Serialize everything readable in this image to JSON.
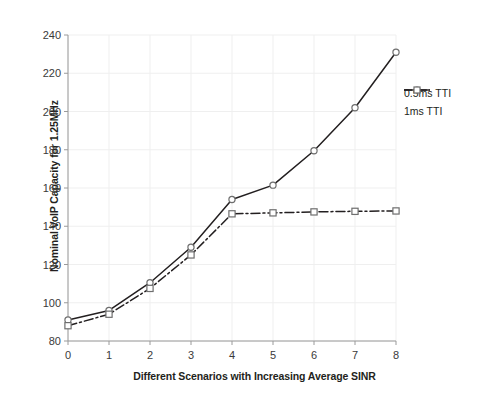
{
  "chart_data": {
    "type": "line",
    "title": "",
    "xlabel": "Different Scenarios with Increasing Average SINR",
    "ylabel": "Nominal VoIP Capacity for 1.25MHz",
    "x": [
      0,
      1,
      2,
      3,
      4,
      5,
      6,
      7,
      8
    ],
    "xlim": [
      0,
      8
    ],
    "ylim": [
      80,
      240
    ],
    "xticks": [
      "0",
      "1",
      "2",
      "3",
      "4",
      "5",
      "6",
      "7",
      "8"
    ],
    "yticks": [
      "80",
      "100",
      "120",
      "140",
      "160",
      "180",
      "200",
      "220",
      "240"
    ],
    "grid": true,
    "legend_position": "right",
    "series": [
      {
        "name": "0.5ms TTI",
        "values": [
          91,
          96,
          110.5,
          129,
          154,
          161.5,
          179.5,
          202,
          231
        ],
        "color": "#231f20",
        "linestyle": "solid",
        "marker": "circle"
      },
      {
        "name": "1ms TTI",
        "values": [
          88,
          94,
          107.5,
          125,
          146.5,
          147,
          147.5,
          147.8,
          148
        ],
        "color": "#231f20",
        "linestyle": "dash-dot",
        "marker": "square"
      }
    ]
  },
  "legend": {
    "items": [
      {
        "label": "0.5ms TTI"
      },
      {
        "label": "1ms TTI"
      }
    ]
  },
  "colors": {
    "axis": "#9a9a9a",
    "grid": "#efefef",
    "line": "#231f20",
    "marker_fill": "#ffffff",
    "background": "#ffffff"
  }
}
